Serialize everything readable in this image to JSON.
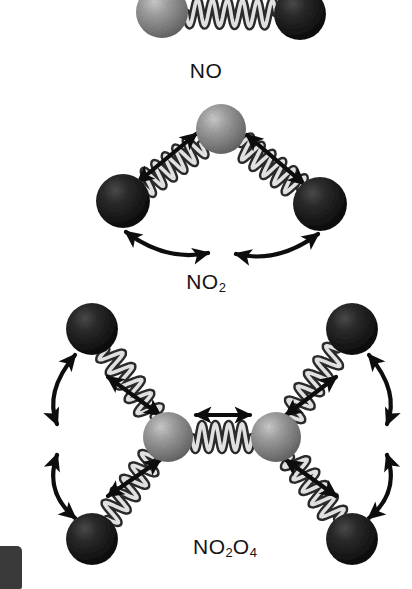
{
  "figure": {
    "title_visible": false,
    "background_color": "#ffffff",
    "width": 412,
    "height": 589,
    "atom_colors": {
      "nitrogen_gray": "#8c8c8c",
      "nitrogen_gray_dark": "#6e6e6e",
      "nitrogen_highlight": "#c6c6c6",
      "oxygen_dark": "#1e1e1e",
      "oxygen_dark_edge": "#080808",
      "oxygen_highlight": "#4a4a4a",
      "spring_light": "#e8e8e8",
      "spring_dark": "#2a2a2a",
      "arrow_color": "#0d0d0d",
      "label_color": "#141414"
    },
    "molecules": [
      {
        "id": "no",
        "name": "NO",
        "label_text": "NO",
        "label_base": "NO",
        "label_subscripts": [],
        "label_x": 206,
        "label_y": 70,
        "atom_count": 2,
        "spring_count": 1,
        "arrow_count": 0,
        "atoms": [
          {
            "element": "N",
            "type": "nitrogen-gray",
            "cx": 162,
            "cy": 12,
            "r": 26
          },
          {
            "element": "O",
            "type": "oxygen-dark",
            "cx": 300,
            "cy": 14,
            "r": 26
          }
        ]
      },
      {
        "id": "no2",
        "name": "NO2",
        "label_text": "NO2",
        "label_base": "NO",
        "label_subscripts": [
          "2"
        ],
        "label_x": 206,
        "label_y": 281,
        "atom_count": 3,
        "spring_count": 2,
        "arrow_count": 4,
        "stretch_arrows": 2,
        "bend_arrows": 2,
        "atoms": [
          {
            "element": "N",
            "type": "nitrogen-gray",
            "cx": 221,
            "cy": 129,
            "r": 25
          },
          {
            "element": "O",
            "type": "oxygen-dark",
            "cx": 123,
            "cy": 201,
            "r": 27
          },
          {
            "element": "O",
            "type": "oxygen-dark",
            "cx": 320,
            "cy": 204,
            "r": 27
          }
        ]
      },
      {
        "id": "no2o4",
        "name": "NO2O4",
        "label_text": "NO2O4",
        "label_base": "NO",
        "label_subscripts": [
          "2",
          "4"
        ],
        "label_x": 225,
        "label_y": 546,
        "atom_count": 6,
        "spring_count": 5,
        "arrow_count": 9,
        "stretch_arrows": 5,
        "bend_arrows": 4,
        "atoms": [
          {
            "element": "N",
            "type": "nitrogen-gray",
            "cx": 168,
            "cy": 437,
            "r": 25
          },
          {
            "element": "N",
            "type": "nitrogen-gray",
            "cx": 276,
            "cy": 437,
            "r": 25
          },
          {
            "element": "O",
            "type": "oxygen-dark",
            "cx": 92,
            "cy": 329,
            "r": 26
          },
          {
            "element": "O",
            "type": "oxygen-dark",
            "cx": 92,
            "cy": 539,
            "r": 26
          },
          {
            "element": "O",
            "type": "oxygen-dark",
            "cx": 352,
            "cy": 329,
            "r": 26
          },
          {
            "element": "O",
            "type": "oxygen-dark",
            "cx": 352,
            "cy": 539,
            "r": 26
          }
        ]
      }
    ],
    "legend_items": [],
    "artifact": {
      "name": "scan-edge-artifact",
      "visible": true
    }
  }
}
